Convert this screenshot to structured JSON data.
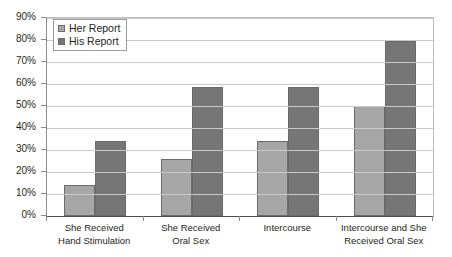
{
  "chart_data": {
    "type": "bar",
    "title": "",
    "xlabel": "",
    "ylabel": "",
    "ylim": [
      0,
      90
    ],
    "grid": true,
    "legend_position": "top-left",
    "categories": [
      "She Received\nHand Stimulation",
      "She Received\nOral Sex",
      "Intercourse",
      "Intercourse and She\nReceived Oral Sex"
    ],
    "category_lines": [
      [
        "She Received",
        "Hand Stimulation"
      ],
      [
        "She Received",
        "Oral Sex"
      ],
      [
        "Intercourse",
        ""
      ],
      [
        "Intercourse and She",
        "Received Oral Sex"
      ]
    ],
    "series": [
      {
        "name": "Her Report",
        "color": "#a6a6a6",
        "values": [
          14,
          26,
          34,
          50
        ]
      },
      {
        "name": "His Report",
        "color": "#767676",
        "values": [
          34,
          58.5,
          58.5,
          79.5
        ]
      }
    ],
    "yticks": [
      {
        "label": "90%",
        "value": 90
      },
      {
        "label": "80%",
        "value": 80
      },
      {
        "label": "70%",
        "value": 70
      },
      {
        "label": "60%",
        "value": 60
      },
      {
        "label": "50%",
        "value": 50
      },
      {
        "label": "40%",
        "value": 40
      },
      {
        "label": "30%",
        "value": 30
      },
      {
        "label": "20%",
        "value": 20
      },
      {
        "label": "10%",
        "value": 10
      },
      {
        "label": "0%",
        "value": 0
      }
    ]
  },
  "legend": {
    "items": [
      {
        "label": "Her Report",
        "swatch": "legend-swatch-her"
      },
      {
        "label": "His Report",
        "swatch": "legend-swatch-his"
      }
    ]
  },
  "colors": {
    "her_report": "#a6a6a6",
    "his_report": "#767676",
    "gridline": "#c9c9c9",
    "axis": "#4d4d4d",
    "text": "#231f20",
    "background": "#ffffff"
  }
}
